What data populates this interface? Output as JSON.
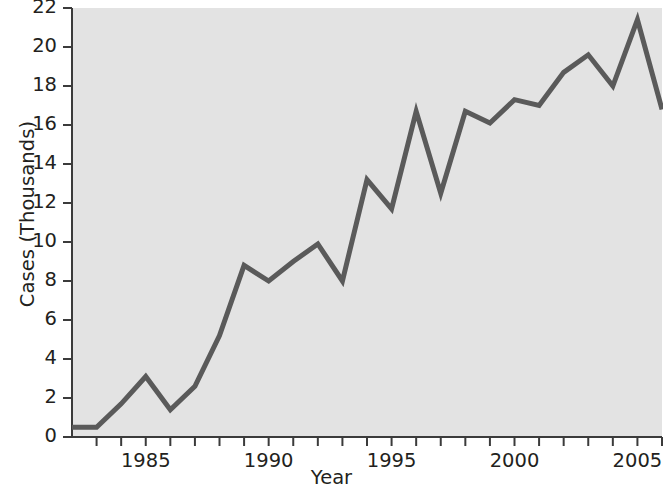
{
  "chart_data": {
    "type": "line",
    "title": "",
    "xlabel": "Year",
    "ylabel": "Cases (Thousands)",
    "xlim": [
      1982,
      2006
    ],
    "ylim": [
      0,
      22
    ],
    "grid": false,
    "legend": null,
    "x_tick_labels": [
      "1985",
      "1990",
      "1995",
      "2000",
      "2005"
    ],
    "x_tick_values": [
      1985,
      1990,
      1995,
      2000,
      2005
    ],
    "x_minor_tick_values": [
      1983,
      1984,
      1986,
      1987,
      1988,
      1989,
      1991,
      1992,
      1993,
      1994,
      1996,
      1997,
      1998,
      1999,
      2001,
      2002,
      2003,
      2004,
      2006
    ],
    "y_tick_labels": [
      "0",
      "2",
      "4",
      "6",
      "8",
      "10",
      "12",
      "14",
      "16",
      "18",
      "20",
      "22"
    ],
    "y_tick_values": [
      0,
      2,
      4,
      6,
      8,
      10,
      12,
      14,
      16,
      18,
      20,
      22
    ],
    "x": [
      1982,
      1983,
      1984,
      1985,
      1986,
      1987,
      1988,
      1989,
      1990,
      1991,
      1992,
      1993,
      1994,
      1995,
      1996,
      1997,
      1998,
      1999,
      2000,
      2001,
      2002,
      2003,
      2004,
      2005,
      2006
    ],
    "values": [
      0.5,
      0.5,
      1.7,
      3.1,
      1.4,
      2.6,
      5.2,
      8.8,
      8.0,
      9.0,
      9.9,
      8.0,
      13.2,
      11.7,
      16.7,
      12.5,
      16.7,
      16.1,
      17.3,
      17.0,
      18.7,
      19.6,
      18.0,
      21.4,
      16.8
    ],
    "series": [
      {
        "name": "Cases",
        "values": [
          0.5,
          0.5,
          1.7,
          3.1,
          1.4,
          2.6,
          5.2,
          8.8,
          8.0,
          9.0,
          9.9,
          8.0,
          13.2,
          11.7,
          16.7,
          12.5,
          16.7,
          16.1,
          17.3,
          17.0,
          18.7,
          19.6,
          18.0,
          21.4,
          16.8
        ]
      }
    ]
  },
  "colors": {
    "line": "#5a5a5a",
    "plot_background": "#e3e3e3",
    "axis": "#3b3b3b",
    "text": "#231f20",
    "page_background": "#ffffff"
  }
}
